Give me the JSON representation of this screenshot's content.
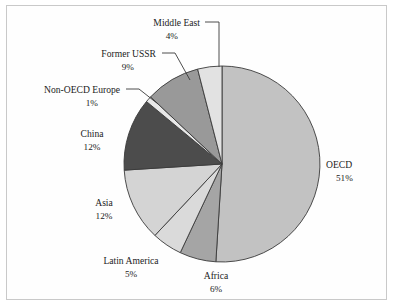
{
  "chart_data": {
    "type": "pie",
    "title": "",
    "xlabel": "",
    "ylabel": "",
    "unit": "%",
    "legend_position": "none",
    "labels_on_slices": false,
    "start_angle_deg": 0,
    "direction": "clockwise",
    "categories": [
      "OECD",
      "Africa",
      "Latin America",
      "Asia",
      "China",
      "Non-OECD Europe",
      "Former USSR",
      "Middle East"
    ],
    "values": [
      51,
      6,
      5,
      12,
      12,
      1,
      9,
      4
    ],
    "slices": [
      {
        "name": "OECD",
        "value": 51,
        "value_label": "51%",
        "color": "#c2c2c2",
        "label_x": 326,
        "label_y": 168,
        "anchor": "start",
        "leader": ""
      },
      {
        "name": "Africa",
        "value": 6,
        "value_label": "6%",
        "color": "#a5a5a5",
        "label_x": 216,
        "label_y": 279,
        "anchor": "middle",
        "leader": ""
      },
      {
        "name": "Latin America",
        "value": 5,
        "value_label": "5%",
        "color": "#dadada",
        "label_x": 131,
        "label_y": 264,
        "anchor": "middle",
        "leader": ""
      },
      {
        "name": "Asia",
        "value": 12,
        "value_label": "12%",
        "color": "#d4d4d4",
        "label_x": 104,
        "label_y": 206,
        "anchor": "middle",
        "leader": ""
      },
      {
        "name": "China",
        "value": 12,
        "value_label": "12%",
        "color": "#4c4c4c",
        "label_x": 92,
        "label_y": 137,
        "anchor": "middle",
        "leader": ""
      },
      {
        "name": "Non-OECD Europe",
        "value": 1,
        "value_label": "1%",
        "color": "#e8e8e8",
        "label_x": 120,
        "label_y": 93,
        "anchor": "end",
        "leader": "M126,89 L139,89 L158,104"
      },
      {
        "name": "Former USSR",
        "value": 9,
        "value_label": "9%",
        "color": "#999999",
        "label_x": 156,
        "label_y": 57,
        "anchor": "end",
        "leader": "M162,53 L175,53 L190,80"
      },
      {
        "name": "Middle East",
        "value": 4,
        "value_label": "4%",
        "color": "#e2e2e2",
        "label_x": 200,
        "label_y": 26,
        "anchor": "end",
        "leader": "M205,22 L219,22 L219,67"
      }
    ],
    "geometry": {
      "center_x": 222,
      "center_y": 164,
      "radius": 98
    },
    "style": {
      "slice_stroke": "#3a3a3a",
      "frame_border": "#c9c9c9",
      "background": "#ffffff",
      "text_color": "#1c1c1c"
    }
  }
}
